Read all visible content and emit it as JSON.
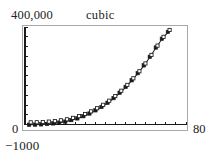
{
  "labels": {
    "y_max": "400,000",
    "y_min": "0",
    "below_axis": "−1000",
    "x_max": "80",
    "title": "cubic"
  },
  "colors": {
    "frame": "#a8a8a8",
    "axis": "#1a1a1a",
    "curve": "#2b2b2b",
    "marker_filled": "#1a1a1a",
    "marker_open_fill": "#ffffff",
    "marker_open_stroke": "#1a1a1a",
    "text": "#222222",
    "background": "#ffffff"
  },
  "chart_data": {
    "type": "scatter",
    "title": "cubic",
    "xlabel": "",
    "ylabel": "",
    "xlim": [
      0,
      80
    ],
    "ylim": [
      -1000,
      400000
    ],
    "grid": false,
    "legend": false,
    "axis_tick_labels": {
      "x": [
        "0",
        "80"
      ],
      "y": [
        "0",
        "400,000"
      ]
    },
    "x_tick_count": 17,
    "y_tick_count": 11,
    "series": [
      {
        "name": "measured",
        "marker": "filled-square",
        "x": [
          2,
          5,
          8,
          11,
          14,
          17,
          20,
          23,
          26,
          29,
          32,
          35,
          38,
          41,
          44,
          47,
          50,
          53,
          56,
          59,
          62,
          65,
          68,
          71
        ],
        "values": [
          200,
          600,
          1600,
          3200,
          5500,
          8800,
          13000,
          19000,
          26000,
          35000,
          46000,
          59000,
          73000,
          90000,
          109000,
          131000,
          155000,
          182000,
          211000,
          243000,
          278000,
          316000,
          352000,
          380000
        ]
      },
      {
        "name": "cubic-fit",
        "marker": "open-square",
        "x": [
          2,
          5,
          8,
          11,
          14,
          17,
          20,
          23,
          26,
          29,
          32,
          35,
          38,
          41,
          44,
          47,
          50,
          53,
          56,
          59,
          62,
          65,
          68,
          71
        ],
        "values": [
          100,
          500,
          1400,
          3000,
          5200,
          8400,
          12500,
          18400,
          25300,
          34200,
          45000,
          57800,
          71800,
          88600,
          107500,
          129400,
          153300,
          180200,
          209100,
          241000,
          276000,
          314000,
          350000,
          378000
        ]
      }
    ]
  }
}
